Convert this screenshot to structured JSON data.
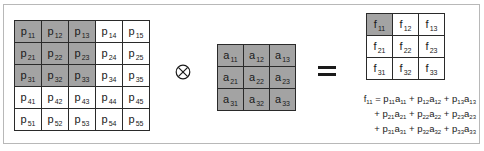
{
  "diagram": {
    "type": "convolution-illustration",
    "input_matrix": {
      "name": "p",
      "rows": 5,
      "cols": 5,
      "cells": [
        [
          {
            "l": "p",
            "s": "11",
            "shade": true
          },
          {
            "l": "p",
            "s": "12",
            "shade": true
          },
          {
            "l": "p",
            "s": "13",
            "shade": true
          },
          {
            "l": "p",
            "s": "14",
            "shade": false
          },
          {
            "l": "p",
            "s": "15",
            "shade": false
          }
        ],
        [
          {
            "l": "p",
            "s": "21",
            "shade": true
          },
          {
            "l": "p",
            "s": "22",
            "shade": true
          },
          {
            "l": "p",
            "s": "23",
            "shade": true
          },
          {
            "l": "p",
            "s": "24",
            "shade": false
          },
          {
            "l": "p",
            "s": "25",
            "shade": false
          }
        ],
        [
          {
            "l": "p",
            "s": "31",
            "shade": true
          },
          {
            "l": "p",
            "s": "32",
            "shade": true
          },
          {
            "l": "p",
            "s": "33",
            "shade": true
          },
          {
            "l": "p",
            "s": "34",
            "shade": false
          },
          {
            "l": "p",
            "s": "35",
            "shade": false
          }
        ],
        [
          {
            "l": "p",
            "s": "41",
            "shade": false
          },
          {
            "l": "p",
            "s": "42",
            "shade": false
          },
          {
            "l": "p",
            "s": "43",
            "shade": false
          },
          {
            "l": "p",
            "s": "44",
            "shade": false
          },
          {
            "l": "p",
            "s": "45",
            "shade": false
          }
        ],
        [
          {
            "l": "p",
            "s": "51",
            "shade": false
          },
          {
            "l": "p",
            "s": "52",
            "shade": false
          },
          {
            "l": "p",
            "s": "53",
            "shade": false
          },
          {
            "l": "p",
            "s": "54",
            "shade": false
          },
          {
            "l": "p",
            "s": "55",
            "shade": false
          }
        ]
      ]
    },
    "operator": "⊗",
    "kernel_matrix": {
      "name": "a",
      "rows": 3,
      "cols": 3,
      "cells": [
        [
          {
            "l": "a",
            "s": "11",
            "shade": true
          },
          {
            "l": "a",
            "s": "12",
            "shade": true
          },
          {
            "l": "a",
            "s": "13",
            "shade": true
          }
        ],
        [
          {
            "l": "a",
            "s": "21",
            "shade": true
          },
          {
            "l": "a",
            "s": "22",
            "shade": true
          },
          {
            "l": "a",
            "s": "23",
            "shade": true
          }
        ],
        [
          {
            "l": "a",
            "s": "31",
            "shade": true
          },
          {
            "l": "a",
            "s": "32",
            "shade": true
          },
          {
            "l": "a",
            "s": "33",
            "shade": true
          }
        ]
      ]
    },
    "equals": "=",
    "output_matrix": {
      "name": "f",
      "rows": 3,
      "cols": 3,
      "cells": [
        [
          {
            "l": "f",
            "s": "11",
            "shade": true
          },
          {
            "l": "f",
            "s": "12",
            "shade": false
          },
          {
            "l": "f",
            "s": "13",
            "shade": false
          }
        ],
        [
          {
            "l": "f",
            "s": "21",
            "shade": false
          },
          {
            "l": "f",
            "s": "22",
            "shade": false
          },
          {
            "l": "f",
            "s": "23",
            "shade": false
          }
        ],
        [
          {
            "l": "f",
            "s": "31",
            "shade": false
          },
          {
            "l": "f",
            "s": "32",
            "shade": false
          },
          {
            "l": "f",
            "s": "33",
            "shade": false
          }
        ]
      ]
    },
    "formula_lines": [
      [
        [
          "f",
          "11"
        ],
        [
          " = ",
          ""
        ],
        [
          "p",
          "11"
        ],
        [
          "a",
          "11"
        ],
        [
          " + ",
          ""
        ],
        [
          "p",
          "12"
        ],
        [
          "a",
          "12"
        ],
        [
          " + ",
          ""
        ],
        [
          "p",
          "13"
        ],
        [
          "a",
          "13"
        ]
      ],
      [
        [
          "+ ",
          ""
        ],
        [
          "p",
          "21"
        ],
        [
          "a",
          "21"
        ],
        [
          " + ",
          ""
        ],
        [
          "p",
          "22"
        ],
        [
          "a",
          "22"
        ],
        [
          " + ",
          ""
        ],
        [
          "p",
          "23"
        ],
        [
          "a",
          "23"
        ]
      ],
      [
        [
          "+ ",
          ""
        ],
        [
          "p",
          "31"
        ],
        [
          "a",
          "31"
        ],
        [
          " + ",
          ""
        ],
        [
          "p",
          "32"
        ],
        [
          "a",
          "32"
        ],
        [
          " + ",
          ""
        ],
        [
          "p",
          "33"
        ],
        [
          "a",
          "33"
        ]
      ]
    ],
    "colors": {
      "shade": "#a3a3a3",
      "border": "#2a2a2a",
      "frame": "#b8b8b8"
    }
  }
}
